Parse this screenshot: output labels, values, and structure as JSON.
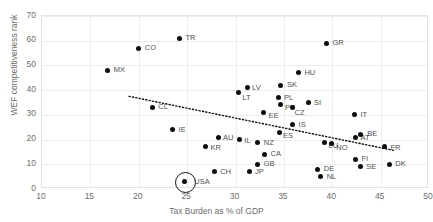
{
  "chart_data": {
    "type": "scatter",
    "title": "",
    "xlabel": "Tax Burden as % of GDP",
    "ylabel": "WEF competitiveness rank",
    "xlim": [
      10,
      50
    ],
    "ylim": [
      0,
      70
    ],
    "xticks": [
      10,
      15,
      20,
      25,
      30,
      35,
      40,
      45,
      50
    ],
    "yticks": [
      0,
      10,
      20,
      30,
      40,
      50,
      60,
      70
    ],
    "grid": true,
    "legend": null,
    "point_color": "#0d0d0d",
    "grid_color": "#ededed",
    "axis_color": "#e2e2e2",
    "label_color": "#6d6d6d",
    "points": [
      {
        "label": "MX",
        "x": 16.8,
        "y": 48.0,
        "lx": 6,
        "ly": -4
      },
      {
        "label": "CO",
        "x": 20.0,
        "y": 57.0,
        "lx": 6,
        "ly": -4
      },
      {
        "label": "TR",
        "x": 24.2,
        "y": 61.0,
        "lx": 6,
        "ly": -4
      },
      {
        "label": "CL",
        "x": 21.4,
        "y": 33.0,
        "lx": 6,
        "ly": -4
      },
      {
        "label": "IE",
        "x": 23.5,
        "y": 24.0,
        "lx": 6,
        "ly": -4
      },
      {
        "label": "GR",
        "x": 39.4,
        "y": 59.0,
        "lx": 6,
        "ly": -4
      },
      {
        "label": "HU",
        "x": 36.5,
        "y": 47.0,
        "lx": 6,
        "ly": -4
      },
      {
        "label": "LT",
        "x": 30.3,
        "y": 39.0,
        "lx": 4,
        "ly": 1
      },
      {
        "label": "LV",
        "x": 31.2,
        "y": 41.0,
        "lx": 5,
        "ly": -4
      },
      {
        "label": "SK",
        "x": 34.7,
        "y": 42.0,
        "lx": 6,
        "ly": -4
      },
      {
        "label": "PL",
        "x": 34.4,
        "y": 37.0,
        "lx": 6,
        "ly": -4
      },
      {
        "label": "SI",
        "x": 37.5,
        "y": 35.0,
        "lx": 6,
        "ly": -4
      },
      {
        "label": "PT",
        "x": 34.6,
        "y": 34.0,
        "lx": 5,
        "ly": -1
      },
      {
        "label": "CZ",
        "x": 35.9,
        "y": 33.0,
        "lx": 2,
        "ly": 2
      },
      {
        "label": "EE",
        "x": 32.9,
        "y": 31.0,
        "lx": 5,
        "ly": 0
      },
      {
        "label": "IS",
        "x": 35.9,
        "y": 26.0,
        "lx": 6,
        "ly": -4
      },
      {
        "label": "ES",
        "x": 34.5,
        "y": 23.0,
        "lx": 4,
        "ly": 0
      },
      {
        "label": "IT",
        "x": 42.3,
        "y": 30.0,
        "lx": 6,
        "ly": -4
      },
      {
        "label": "AT",
        "x": 42.4,
        "y": 21.0,
        "lx": 5,
        "ly": -3
      },
      {
        "label": "BE",
        "x": 42.9,
        "y": 22.0,
        "lx": 7,
        "ly": -5
      },
      {
        "label": "LU",
        "x": 39.2,
        "y": 19.0,
        "lx": 4,
        "ly": 0
      },
      {
        "label": "NO",
        "x": 39.9,
        "y": 18.5,
        "lx": 5,
        "ly": 1
      },
      {
        "label": "FR",
        "x": 45.4,
        "y": 17.0,
        "lx": 6,
        "ly": -3
      },
      {
        "label": "IL",
        "x": 30.4,
        "y": 20.0,
        "lx": 5,
        "ly": -3
      },
      {
        "label": "NZ",
        "x": 32.3,
        "y": 19.0,
        "lx": 6,
        "ly": -3
      },
      {
        "label": "AU",
        "x": 28.2,
        "y": 21.0,
        "lx": 5,
        "ly": -3
      },
      {
        "label": "KR",
        "x": 26.9,
        "y": 17.0,
        "lx": 5,
        "ly": -3
      },
      {
        "label": "CA",
        "x": 33.0,
        "y": 14.0,
        "lx": 6,
        "ly": -4
      },
      {
        "label": "GB",
        "x": 32.3,
        "y": 10.0,
        "lx": 6,
        "ly": -4
      },
      {
        "label": "JP",
        "x": 31.4,
        "y": 7.0,
        "lx": 6,
        "ly": -4
      },
      {
        "label": "CH",
        "x": 27.8,
        "y": 7.0,
        "lx": 6,
        "ly": -4
      },
      {
        "label": "DE",
        "x": 38.5,
        "y": 8.0,
        "lx": 6,
        "ly": -4
      },
      {
        "label": "NL",
        "x": 38.8,
        "y": 5.0,
        "lx": 6,
        "ly": -4
      },
      {
        "label": "FI",
        "x": 42.4,
        "y": 12.0,
        "lx": 6,
        "ly": -4
      },
      {
        "label": "SE",
        "x": 42.9,
        "y": 9.0,
        "lx": 6,
        "ly": -4
      },
      {
        "label": "DK",
        "x": 45.9,
        "y": 10.0,
        "lx": 6,
        "ly": -4
      },
      {
        "label": "USA",
        "x": 24.7,
        "y": 3.0,
        "lx": 10,
        "ly": -4,
        "highlighted": true
      }
    ],
    "trendline": {
      "x0": 19.0,
      "y0": 37.5,
      "x1": 46.5,
      "y1": 15.5,
      "style": "dotted",
      "color": "#111111"
    }
  }
}
